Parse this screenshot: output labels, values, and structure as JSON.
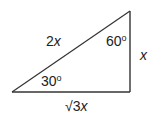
{
  "diagram": {
    "type": "right-triangle",
    "stroke_color": "#333333",
    "background": "#ffffff",
    "vertices": {
      "left": [
        12,
        92
      ],
      "right_angle": [
        130,
        92
      ],
      "top": [
        130,
        11
      ]
    },
    "sides": {
      "hypotenuse": {
        "coefficient": "2",
        "variable": "x"
      },
      "vertical_leg": {
        "coefficient": "",
        "variable": "x"
      },
      "base": {
        "radical": "√3",
        "variable": "x"
      }
    },
    "angles": {
      "top": {
        "value": "60",
        "unit": "o"
      },
      "bottom_left": {
        "value": "30",
        "unit": "o"
      }
    }
  }
}
